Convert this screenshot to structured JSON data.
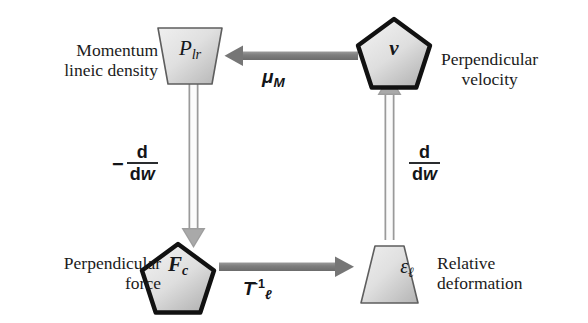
{
  "diagram": {
    "type": "causal-cycle",
    "title": "",
    "nodes": [
      {
        "id": "momentum-lineic-density",
        "symbol": "P",
        "symbol_subscript": "lr",
        "label_line1": "Momentum",
        "label_line2": "lineic density",
        "shape": "inverted-trapezoid",
        "border": "thin",
        "position": "top-left"
      },
      {
        "id": "perpendicular-velocity",
        "symbol": "v",
        "symbol_subscript": "",
        "label_line1": "Perpendicular",
        "label_line2": "velocity",
        "shape": "pentagon",
        "border": "thick",
        "position": "top-right"
      },
      {
        "id": "perpendicular-force",
        "symbol": "F",
        "symbol_subscript": "c",
        "label_line1": "Perpendicular",
        "label_line2": "force",
        "shape": "pentagon",
        "border": "thick",
        "position": "bottom-left"
      },
      {
        "id": "relative-deformation",
        "symbol": "ε",
        "symbol_subscript": "ℓ",
        "label_line1": "Relative",
        "label_line2": "deformation",
        "shape": "trapezoid",
        "border": "thin",
        "position": "bottom-right"
      }
    ],
    "edges": [
      {
        "id": "velocity-to-momentum",
        "from": "perpendicular-velocity",
        "to": "momentum-lineic-density",
        "direction": "left",
        "style": "solid-bar",
        "label_symbol": "μ",
        "label_subscript": "M",
        "label_superscript": ""
      },
      {
        "id": "momentum-to-force",
        "from": "momentum-lineic-density",
        "to": "perpendicular-force",
        "direction": "down",
        "style": "double-line",
        "label_sign": "−",
        "label_numerator": "d",
        "label_denominator_d": "d",
        "label_denominator_var": "w"
      },
      {
        "id": "force-to-deformation",
        "from": "perpendicular-force",
        "to": "relative-deformation",
        "direction": "right",
        "style": "solid-bar",
        "label_symbol": "T",
        "label_subscript": "ℓ",
        "label_superscript": "−1"
      },
      {
        "id": "deformation-to-velocity",
        "from": "relative-deformation",
        "to": "perpendicular-velocity",
        "direction": "up",
        "style": "double-line",
        "label_sign": "",
        "label_numerator": "d",
        "label_denominator_d": "d",
        "label_denominator_var": "w"
      }
    ],
    "colors": {
      "arrow_gray": "#8a8a8a",
      "arrow_gray_dark": "#6f6f6f",
      "shape_fill_light": "#ececec",
      "shape_fill_dark": "#b9b9b9",
      "shape_border_thin": "#5a5a5a",
      "shape_border_thick": "#111111",
      "text": "#1b1b1b",
      "background": "#ffffff"
    }
  }
}
